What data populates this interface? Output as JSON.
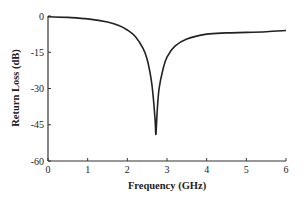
{
  "chart_data": {
    "type": "line",
    "title": "",
    "xlabel": "Frequency (GHz)",
    "ylabel": "Return Loss (dB)",
    "xlim": [
      0,
      6
    ],
    "ylim": [
      -60,
      0
    ],
    "xticks": [
      0,
      1,
      2,
      3,
      4,
      5,
      6
    ],
    "yticks": [
      0,
      -15,
      -30,
      -45,
      -60
    ],
    "grid": false,
    "legend": null,
    "series": [
      {
        "name": "S11",
        "color": "#222222",
        "x": [
          0,
          0.5,
          1.0,
          1.5,
          1.8,
          2.0,
          2.2,
          2.4,
          2.5,
          2.6,
          2.65,
          2.7,
          2.72,
          2.75,
          2.8,
          2.9,
          3.0,
          3.2,
          3.5,
          4.0,
          4.5,
          5.0,
          5.5,
          6.0
        ],
        "y": [
          -0.3,
          -0.6,
          -1.2,
          -2.5,
          -4.0,
          -5.8,
          -8.5,
          -13.5,
          -18,
          -26,
          -33,
          -43,
          -49,
          -40,
          -30,
          -22,
          -17,
          -12.5,
          -9.5,
          -7.5,
          -7.0,
          -6.8,
          -6.5,
          -6.0
        ]
      }
    ]
  }
}
